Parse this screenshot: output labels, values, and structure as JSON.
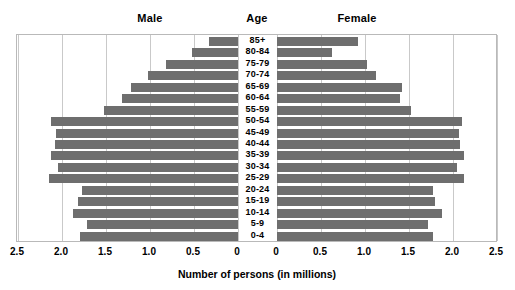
{
  "headers": {
    "male": "Male",
    "age": "Age",
    "female": "Female"
  },
  "axis": {
    "title": "Number of persons (in millions)",
    "ticks_left": [
      "2.5",
      "2.0",
      "1.5",
      "1.0",
      "0.5",
      "0"
    ],
    "ticks_right": [
      "0",
      "0.5",
      "1.0",
      "1.5",
      "2.0",
      "2.5"
    ]
  },
  "colors": {
    "bar": "#6e6e6e",
    "grid": "#c9c9c9",
    "frame": "#b9b9b9",
    "text": "#000000"
  },
  "chart_data": {
    "type": "bar",
    "title": "",
    "subtype": "population-pyramid",
    "xlabel": "Number of persons (in millions)",
    "ylabel": "Age",
    "xlim_left": [
      2.5,
      0
    ],
    "xlim_right": [
      0,
      2.5
    ],
    "xticks": [
      0,
      0.5,
      1.0,
      1.5,
      2.0,
      2.5
    ],
    "grid": true,
    "legend_position": "top",
    "categories": [
      "85+",
      "80-84",
      "75-79",
      "70-74",
      "65-69",
      "60-64",
      "55-59",
      "50-54",
      "45-49",
      "40-44",
      "35-39",
      "30-34",
      "25-29",
      "20-24",
      "15-19",
      "10-14",
      "5-9",
      "0-4"
    ],
    "series": [
      {
        "name": "Male",
        "direction": "left",
        "values": [
          0.33,
          0.52,
          0.82,
          1.02,
          1.22,
          1.32,
          1.52,
          2.12,
          2.07,
          2.08,
          2.12,
          2.05,
          2.15,
          1.77,
          1.82,
          1.87,
          1.72,
          1.8
        ]
      },
      {
        "name": "Female",
        "direction": "right",
        "values": [
          0.92,
          0.62,
          1.02,
          1.12,
          1.42,
          1.4,
          1.52,
          2.1,
          2.07,
          2.08,
          2.12,
          2.05,
          2.12,
          1.77,
          1.8,
          1.87,
          1.72,
          1.77
        ]
      }
    ]
  }
}
